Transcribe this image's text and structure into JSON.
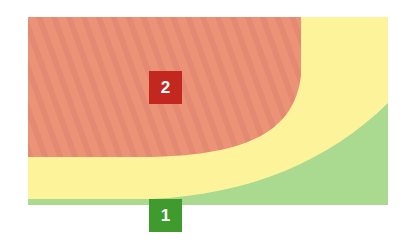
{
  "diagram": {
    "zones": [
      {
        "id": "zone-green",
        "label": "1",
        "color": "#a6d98c",
        "badge_color": "#3f9b2e"
      },
      {
        "id": "zone-yellow",
        "label": "",
        "color": "#fcf49a"
      },
      {
        "id": "zone-red",
        "label": "2",
        "color": "#eb9175",
        "badge_color": "#c2281f"
      }
    ],
    "badges": [
      {
        "label": "2",
        "color": "#c2281f"
      },
      {
        "label": "1",
        "color": "#3f9b2e"
      }
    ]
  }
}
